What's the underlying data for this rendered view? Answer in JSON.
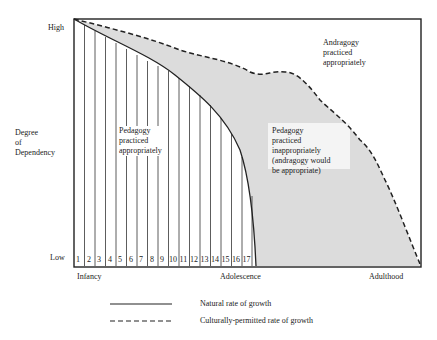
{
  "diagram": {
    "y_axis": {
      "title_lines": [
        "Degree",
        "of",
        "Dependency"
      ],
      "high_label": "High",
      "low_label": "Low"
    },
    "x_axis": {
      "stage_labels": [
        "Infancy",
        "Adolescence",
        "Adulthood"
      ],
      "segment_numbers": [
        "1",
        "2",
        "3",
        "4",
        "5",
        "6",
        "7",
        "8",
        "9",
        "10",
        "11",
        "12",
        "13",
        "14",
        "15",
        "16",
        "17"
      ]
    },
    "regions": {
      "pedagogy_appropriate": [
        "Pedagogy",
        "practiced",
        "appropriately"
      ],
      "pedagogy_inappropriate": [
        "Pedagogy",
        "practiced",
        "inappropriately",
        "(andragogy would",
        "be appropriate)"
      ],
      "andragogy_appropriate": [
        "Andragogy",
        "practiced",
        "appropriately"
      ]
    },
    "legend": [
      {
        "style": "solid",
        "label": "Natural rate of growth"
      },
      {
        "style": "dashed",
        "label": "Culturally-permitted rate of growth"
      }
    ],
    "colors": {
      "line": "#222222",
      "shaded_region": "#d9d9d9",
      "background": "#ffffff"
    }
  }
}
